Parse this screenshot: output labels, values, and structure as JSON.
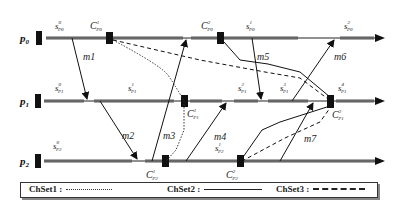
{
  "diagram": {
    "processes": [
      {
        "id": "p0",
        "label": "p",
        "sub": "0",
        "y": 38
      },
      {
        "id": "p1",
        "label": "p",
        "sub": "1",
        "y": 101
      },
      {
        "id": "p2",
        "label": "p",
        "sub": "2",
        "y": 161
      }
    ],
    "state_labels": {
      "s0_p0": {
        "base": "s",
        "sup": "0",
        "sub": "P0"
      },
      "C1_p0": {
        "base": "C",
        "sup": "1",
        "sub": "P0"
      },
      "C2_p0": {
        "base": "C",
        "sup": "2",
        "sub": "P0"
      },
      "s1_p0": {
        "base": "s",
        "sup": "1",
        "sub": "P0"
      },
      "s2_p0": {
        "base": "s",
        "sup": "2",
        "sub": "P0"
      },
      "s0_p1": {
        "base": "s",
        "sup": "0",
        "sub": "P1"
      },
      "s1_p1": {
        "base": "s",
        "sup": "1",
        "sub": "P1"
      },
      "C1_p1": {
        "base": "C",
        "sup": "1",
        "sub": "P1"
      },
      "s2_p1": {
        "base": "s",
        "sup": "2",
        "sub": "P1"
      },
      "s3_p1": {
        "base": "s",
        "sup": "3",
        "sub": "P1"
      },
      "s4_p1": {
        "base": "s",
        "sup": "4",
        "sub": "P1"
      },
      "C2_p1": {
        "base": "C",
        "sup": "2",
        "sub": "P1"
      },
      "s0_p2": {
        "base": "s",
        "sup": "0",
        "sub": "P2"
      },
      "C1_p2": {
        "base": "C",
        "sup": "1",
        "sub": "P2"
      },
      "s1_p2": {
        "base": "s",
        "sup": "1",
        "sub": "P2"
      },
      "C2_p2": {
        "base": "C",
        "sup": "2",
        "sub": "P2"
      }
    },
    "messages": {
      "m1": "m1",
      "m2": "m2",
      "m3": "m3",
      "m4": "m4",
      "m5": "m5",
      "m6": "m6",
      "m7": "m7"
    }
  },
  "legend": {
    "items": [
      {
        "label": "ChSet1 :",
        "style": "dotted"
      },
      {
        "label": "ChSet2 :",
        "style": "solid"
      },
      {
        "label": "ChSet3 :",
        "style": "dashed"
      }
    ]
  }
}
